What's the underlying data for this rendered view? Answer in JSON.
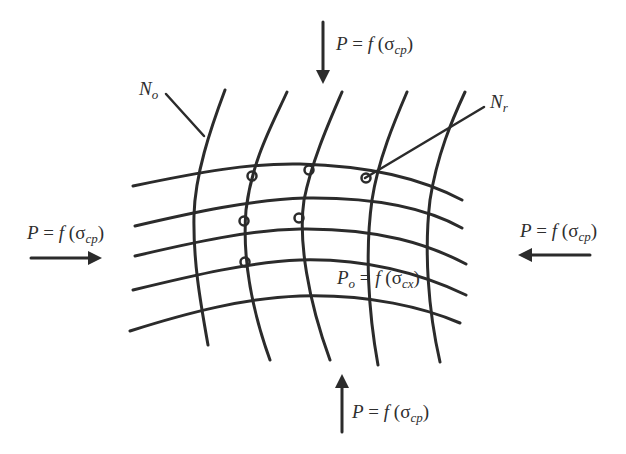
{
  "diagram": {
    "labels": {
      "top_load": {
        "lhs": "P",
        "func": "f",
        "sym": "σ",
        "sub": "cp"
      },
      "bottom_load": {
        "lhs": "P",
        "func": "f",
        "sym": "σ",
        "sub": "cp"
      },
      "left_load": {
        "lhs": "P",
        "func": "f",
        "sym": "σ",
        "sub": "cp"
      },
      "right_load": {
        "lhs": "P",
        "func": "f",
        "sym": "σ",
        "sub": "cp"
      },
      "internal": {
        "lhs": "P",
        "lhs_sub": "o",
        "func": "f",
        "sym": "σ",
        "sub": "cx"
      },
      "node_original": {
        "sym": "N",
        "sub": "o"
      },
      "node_rotated": {
        "sym": "N",
        "sub": "r"
      }
    },
    "arrows": [
      {
        "name": "top",
        "direction": "down"
      },
      {
        "name": "bottom",
        "direction": "up"
      },
      {
        "name": "left",
        "direction": "right"
      },
      {
        "name": "right",
        "direction": "left"
      }
    ],
    "mesh": {
      "horizontal_lines": 5,
      "vertical_lines": 5,
      "marked_nodes": 5
    },
    "stroke_color": "#2b2b2b"
  }
}
